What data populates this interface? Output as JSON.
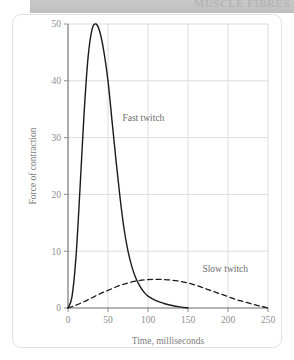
{
  "banner": {
    "title": "MUSCLE FIBRES"
  },
  "chart_data": {
    "type": "line",
    "title": "",
    "xlabel": "Time, milliseconds",
    "ylabel": "Force of contraction",
    "xlim": [
      0,
      250
    ],
    "ylim": [
      0,
      50
    ],
    "xticks": [
      0,
      50,
      100,
      150,
      200,
      250
    ],
    "yticks": [
      0,
      10,
      20,
      30,
      40,
      50
    ],
    "grid": true,
    "legend_position": "inline-annotation",
    "series": [
      {
        "name": "Fast twitch",
        "style": "solid",
        "color": "#1a1a1a",
        "label_x": 68,
        "label_y": 33,
        "x": [
          0,
          5,
          10,
          15,
          20,
          25,
          30,
          35,
          40,
          45,
          50,
          55,
          60,
          65,
          70,
          75,
          80,
          85,
          90,
          95,
          100,
          110,
          120,
          130,
          140,
          150
        ],
        "y": [
          0,
          2,
          9,
          21,
          34,
          44,
          49,
          50,
          48.5,
          45,
          40,
          33,
          26,
          19.5,
          14,
          10,
          7.2,
          5.2,
          3.8,
          2.8,
          2.1,
          1.3,
          0.8,
          0.45,
          0.2,
          0
        ]
      },
      {
        "name": "Slow twitch",
        "style": "dashed",
        "color": "#1a1a1a",
        "label_x": 168,
        "label_y": 6.4,
        "x": [
          0,
          10,
          20,
          30,
          40,
          50,
          60,
          70,
          80,
          90,
          100,
          110,
          120,
          130,
          140,
          150,
          160,
          170,
          180,
          190,
          200,
          210,
          220,
          230,
          240,
          250
        ],
        "y": [
          0,
          0.5,
          1.1,
          1.8,
          2.5,
          3.1,
          3.7,
          4.2,
          4.6,
          4.85,
          5.0,
          5.05,
          5.0,
          4.9,
          4.7,
          4.4,
          4.0,
          3.5,
          3.0,
          2.5,
          2.0,
          1.5,
          1.1,
          0.7,
          0.35,
          0
        ]
      }
    ]
  }
}
